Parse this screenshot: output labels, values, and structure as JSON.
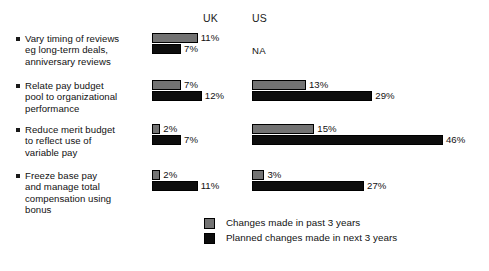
{
  "chart_data": {
    "type": "bar",
    "title": "",
    "subtitle": "",
    "xlabel": "",
    "ylabel": "",
    "orientation": "horizontal",
    "grid": false,
    "legend_position": "bottom-center",
    "value_suffix": "%",
    "px_per_percent": 4.15,
    "column_headers": [
      "UK",
      "US"
    ],
    "categories": [
      "Vary timing of reviews eg long-term deals, anniversary reviews",
      "Relate pay budget pool to organizational performance",
      "Reduce merit budget to reflect use of variable pay",
      "Freeze base pay and manage total compensation using bonus"
    ],
    "category_lines": [
      [
        "Vary timing of reviews",
        "eg long-term deals,",
        "anniversary reviews"
      ],
      [
        "Relate pay budget",
        "pool to organizational",
        "performance"
      ],
      [
        "Reduce merit budget",
        "to reflect use of",
        "variable pay"
      ],
      [
        "Freeze base pay",
        "and manage total",
        "compensation using",
        "bonus"
      ]
    ],
    "series": [
      {
        "name": "Changes made in past 3 years",
        "color": "#737373",
        "uk_values": [
          11,
          7,
          2,
          2
        ],
        "us_values": [
          null,
          13,
          15,
          3
        ],
        "uk_labels": [
          "11%",
          "7%",
          "2%",
          "2%"
        ],
        "us_labels": [
          "NA",
          "13%",
          "15%",
          "3%"
        ]
      },
      {
        "name": "Planned changes made in next 3 years",
        "color": "#0d0d0d",
        "uk_values": [
          7,
          12,
          7,
          11
        ],
        "us_values": [
          null,
          29,
          46,
          27
        ],
        "uk_labels": [
          "7%",
          "12%",
          "7%",
          "11%"
        ],
        "us_labels": [
          "",
          "29%",
          "46%",
          "27%"
        ]
      }
    ],
    "not_available_label": "NA",
    "xlim": [
      0,
      50
    ]
  },
  "headers": {
    "uk": "UK",
    "us": "US"
  },
  "rows": [
    {
      "label_lines": [
        "Vary timing of reviews",
        "eg long-term deals,",
        "anniversary reviews"
      ],
      "uk": {
        "past": {
          "value": 11,
          "label": "11%"
        },
        "next": {
          "value": 7,
          "label": "7%"
        }
      },
      "us": {
        "na": "NA"
      }
    },
    {
      "label_lines": [
        "Relate pay budget",
        "pool to organizational",
        "performance"
      ],
      "uk": {
        "past": {
          "value": 7,
          "label": "7%"
        },
        "next": {
          "value": 12,
          "label": "12%"
        }
      },
      "us": {
        "past": {
          "value": 13,
          "label": "13%"
        },
        "next": {
          "value": 29,
          "label": "29%"
        }
      }
    },
    {
      "label_lines": [
        "Reduce merit budget",
        "to reflect use of",
        "variable pay"
      ],
      "uk": {
        "past": {
          "value": 2,
          "label": "2%"
        },
        "next": {
          "value": 7,
          "label": "7%"
        }
      },
      "us": {
        "past": {
          "value": 15,
          "label": "15%"
        },
        "next": {
          "value": 46,
          "label": "46%"
        }
      }
    },
    {
      "label_lines": [
        "Freeze base pay",
        "and manage total",
        "compensation using",
        "bonus"
      ],
      "uk": {
        "past": {
          "value": 2,
          "label": "2%"
        },
        "next": {
          "value": 11,
          "label": "11%"
        }
      },
      "us": {
        "past": {
          "value": 3,
          "label": "3%"
        },
        "next": {
          "value": 27,
          "label": "27%"
        }
      }
    }
  ],
  "legend": {
    "items": [
      {
        "label": "Changes made in past 3 years",
        "color": "#737373"
      },
      {
        "label": "Planned changes made in next 3 years",
        "color": "#0d0d0d"
      }
    ]
  },
  "colors": {
    "past_series": "#737373",
    "next_series": "#0d0d0d",
    "text": "#111111",
    "background": "#ffffff"
  }
}
